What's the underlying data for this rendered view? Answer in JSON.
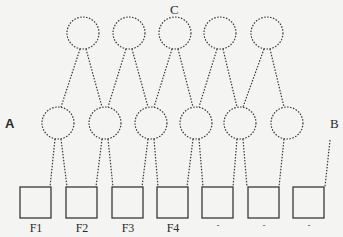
{
  "diagram": {
    "labels": {
      "top": "C",
      "left": "A",
      "right": "B"
    },
    "boxes": [
      {
        "label": "F1"
      },
      {
        "label": "F2"
      },
      {
        "label": "F3"
      },
      {
        "label": "F4"
      },
      {
        "label": "-"
      },
      {
        "label": "-"
      },
      {
        "label": "-"
      }
    ],
    "top_nodes": 5,
    "middle_nodes": 6,
    "colors": {
      "stroke": "#3a3a3a",
      "background": "#f4f4f2"
    }
  }
}
